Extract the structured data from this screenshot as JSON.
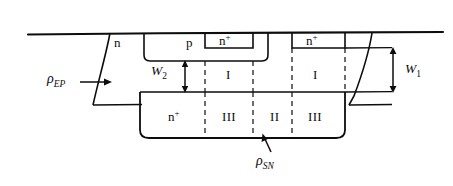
{
  "figure": {
    "stroke_color": "#0d0d0d",
    "background": "#ffffff"
  },
  "labels": {
    "n_epi": {
      "text": "n",
      "x": 114,
      "y": 36
    },
    "p_well": {
      "text": "p",
      "x": 186,
      "y": 36
    },
    "n_plus_source": {
      "text": "n",
      "sup": "+",
      "x": 219,
      "y": 34
    },
    "n_plus_drain": {
      "text": "n",
      "sup": "+",
      "x": 306,
      "y": 34
    },
    "n_plus_buried": {
      "text": "n",
      "sup": "+",
      "x": 168,
      "y": 110
    },
    "region_I_left": {
      "text": "I",
      "x": 226,
      "y": 68
    },
    "region_I_right": {
      "text": "I",
      "x": 313,
      "y": 68
    },
    "region_III_left": {
      "text": "III",
      "x": 222,
      "y": 110
    },
    "region_II": {
      "text": "II",
      "x": 270,
      "y": 110
    },
    "region_III_right": {
      "text": "III",
      "x": 308,
      "y": 110
    },
    "W2": {
      "text": "W",
      "sub": "2",
      "x": 151,
      "y": 64
    },
    "W1": {
      "text": "W",
      "sub": "1",
      "x": 405,
      "y": 62
    },
    "rho_EP": {
      "text": "ρ",
      "sub": "EP",
      "x": 47,
      "y": 72
    },
    "rho_SN": {
      "text": "ρ",
      "sub": "SN",
      "x": 256,
      "y": 154
    }
  },
  "annotations": {
    "arrow_rho_ep": {
      "from_x": 85,
      "from_y": 82,
      "to_x": 112,
      "to_y": 82
    },
    "arrow_rho_sn": {
      "from_x": 270,
      "from_y": 152,
      "to_x": 263,
      "to_y": 135
    },
    "dim_W1": {
      "x": 393,
      "top_y": 48,
      "bottom_y": 92
    },
    "dim_W2": {
      "x": 185,
      "top_y": 61,
      "bottom_y": 92
    }
  },
  "geometry": {
    "surface_line_y": 33,
    "surface_line_x1": 28,
    "surface_line_x2": 443,
    "junction_line_y": 92,
    "buried_bottom_y": 138,
    "p_well_left": 144,
    "p_well_right": 268,
    "p_well_bottom": 61,
    "n_plus_source_left": 205,
    "n_plus_source_right": 253,
    "n_plus_source_bottom": 48,
    "n_plus_drain_left": 292,
    "n_plus_drain_right": 345,
    "n_plus_drain_bottom": 48,
    "buried_left": 140,
    "buried_right": 345,
    "dashed_x": [
      205,
      253,
      292
    ]
  }
}
